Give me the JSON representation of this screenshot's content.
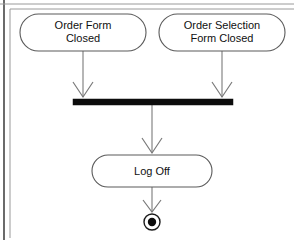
{
  "diagram": {
    "type": "uml-activity-diagram",
    "background_color": "#ffffff",
    "line_color": "#7a7a7a",
    "node_stroke_color": "#5a5a5a",
    "bar_color": "#0c0c0c",
    "frame_color": "#9a9a9a",
    "frame_edge_color": "#2c2c2c",
    "nodes": [
      {
        "id": "order-form-closed",
        "kind": "activity-state",
        "line1": "Order Form",
        "line2": "Closed",
        "x": 20,
        "y": 14,
        "width": 126,
        "height": 37
      },
      {
        "id": "order-selection-form-closed",
        "kind": "activity-state",
        "line1": "Order Selection",
        "line2": "Form Closed",
        "x": 159,
        "y": 14,
        "width": 126,
        "height": 37
      },
      {
        "id": "log-off",
        "kind": "activity-state",
        "line1": "Log Off",
        "line2": "",
        "x": 92,
        "y": 155,
        "width": 120,
        "height": 32
      }
    ],
    "join_bar": {
      "id": "join-synchronization-bar",
      "kind": "join-bar",
      "x": 73,
      "y": 99,
      "width": 160,
      "height": 6
    },
    "final_state": {
      "id": "final-state",
      "kind": "final-state",
      "cx": 152,
      "cy": 222,
      "outer_radius": 8,
      "inner_radius": 4
    },
    "transitions": [
      {
        "id": "t1",
        "from": "order-form-closed",
        "to": "join-synchronization-bar",
        "x1": 83,
        "y1": 51,
        "x2": 83,
        "y2": 98
      },
      {
        "id": "t2",
        "from": "order-selection-form-closed",
        "to": "join-synchronization-bar",
        "x1": 222,
        "y1": 51,
        "x2": 222,
        "y2": 98
      },
      {
        "id": "t3",
        "from": "join-synchronization-bar",
        "to": "log-off",
        "x1": 152,
        "y1": 105,
        "x2": 152,
        "y2": 154
      },
      {
        "id": "t4",
        "from": "log-off",
        "to": "final-state",
        "x1": 152,
        "y1": 187,
        "x2": 152,
        "y2": 213
      }
    ],
    "frame": {
      "top_line_y": 4,
      "left_edge_x": 4,
      "inner_left_x": 10,
      "inner_top_y": 9
    }
  }
}
